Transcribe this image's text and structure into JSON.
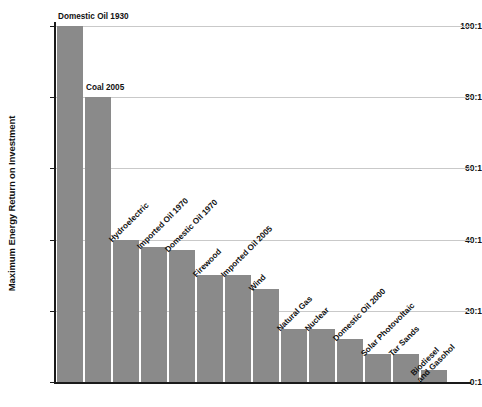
{
  "chart_data": {
    "type": "bar",
    "title": "",
    "xlabel": "",
    "ylabel": "Maximum Energy Return on Investment",
    "ylim": [
      0,
      100
    ],
    "grid": true,
    "legend": "none",
    "y_tick_labels": [
      "0:1",
      "20:1",
      "40:1",
      "60:1",
      "80:1",
      "100:1"
    ],
    "y_tick_values": [
      0,
      20,
      40,
      60,
      80,
      100
    ],
    "categories": [
      "Domestic Oil 1930",
      "Coal 2005",
      "Hydroelectric",
      "Imported Oil 1970",
      "Domestic Oil 1970",
      "Firewood",
      "Imported Oil 2005",
      "Wind",
      "Natural Gas",
      "Nuclear",
      "Domestic Oil 2000",
      "Solar Photovoltaic",
      "Tar Sands",
      "Biodiesel\nand Gasohol"
    ],
    "values": [
      100,
      80,
      40,
      38,
      37,
      30,
      30,
      26,
      15,
      15,
      12,
      8,
      8,
      3.5
    ],
    "bar_color": "#8a8a8a",
    "grid_color": "#c9c9c9",
    "axis_color": "#1a1a1a",
    "background_color": "#ffffff"
  },
  "label_layout": [
    {
      "rotated": false,
      "two_line": false
    },
    {
      "rotated": false,
      "two_line": false
    },
    {
      "rotated": true,
      "two_line": false
    },
    {
      "rotated": true,
      "two_line": false
    },
    {
      "rotated": true,
      "two_line": false
    },
    {
      "rotated": true,
      "two_line": false
    },
    {
      "rotated": true,
      "two_line": false
    },
    {
      "rotated": true,
      "two_line": false
    },
    {
      "rotated": true,
      "two_line": false
    },
    {
      "rotated": true,
      "two_line": false
    },
    {
      "rotated": true,
      "two_line": false
    },
    {
      "rotated": true,
      "two_line": false
    },
    {
      "rotated": true,
      "two_line": false
    },
    {
      "rotated": true,
      "two_line": true
    }
  ]
}
